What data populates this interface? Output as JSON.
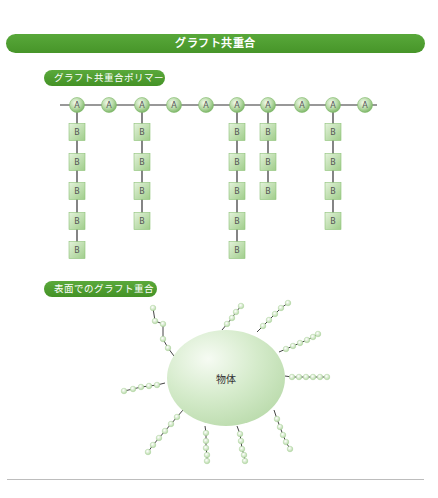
{
  "title": "グラフト共重合",
  "sections": {
    "polymer": {
      "label": "グラフト共重合ポリマー",
      "backbone": {
        "y": 105,
        "x_start": 60,
        "x_end": 377,
        "monomer_label": "A",
        "monomers_x": [
          77,
          109,
          142,
          174,
          206,
          237,
          268,
          302,
          333,
          365
        ]
      },
      "branch_label": "B",
      "branch_row_y": [
        132,
        162,
        191,
        221,
        250
      ],
      "branches": [
        {
          "monomer_index": 0,
          "count": 5
        },
        {
          "monomer_index": 2,
          "count": 4
        },
        {
          "monomer_index": 5,
          "count": 5
        },
        {
          "monomer_index": 6,
          "count": 3
        },
        {
          "monomer_index": 8,
          "count": 4
        }
      ]
    },
    "surface": {
      "label": "表面でのグラフト重合",
      "object_label": "物体",
      "object": {
        "cx": 226,
        "cy": 378,
        "rx": 59,
        "ry": 48
      },
      "chains": [
        [
          [
            174,
            356
          ],
          [
            168,
            348
          ],
          [
            163,
            339
          ],
          [
            163,
            324
          ],
          [
            155,
            321
          ],
          [
            153,
            308
          ]
        ],
        [
          [
            222,
            330
          ],
          [
            227,
            324
          ],
          [
            232,
            318
          ],
          [
            236,
            312
          ],
          [
            241,
            306
          ]
        ],
        [
          [
            257,
            332
          ],
          [
            263,
            326
          ],
          [
            269,
            320
          ],
          [
            275,
            314
          ],
          [
            281,
            308
          ],
          [
            288,
            303
          ]
        ],
        [
          [
            279,
            352
          ],
          [
            286,
            349
          ],
          [
            293,
            346
          ],
          [
            300,
            343
          ],
          [
            307,
            340
          ],
          [
            313,
            337
          ],
          [
            318,
            334
          ]
        ],
        [
          [
            285,
            376
          ],
          [
            292,
            377
          ],
          [
            299,
            377
          ],
          [
            306,
            377
          ],
          [
            313,
            377
          ],
          [
            320,
            377
          ],
          [
            327,
            377
          ]
        ],
        [
          [
            274,
            410
          ],
          [
            277,
            419
          ],
          [
            280,
            427
          ],
          [
            283,
            435
          ],
          [
            286,
            442
          ],
          [
            290,
            449
          ]
        ],
        [
          [
            237,
            426
          ],
          [
            240,
            434
          ],
          [
            241,
            441
          ],
          [
            242,
            449
          ],
          [
            244,
            455
          ],
          [
            245,
            461
          ]
        ],
        [
          [
            205,
            426
          ],
          [
            206,
            433
          ],
          [
            206,
            441
          ],
          [
            206,
            448
          ],
          [
            207,
            455
          ],
          [
            207,
            461
          ]
        ],
        [
          [
            183,
            410
          ],
          [
            177,
            417
          ],
          [
            171,
            424
          ],
          [
            165,
            431
          ],
          [
            159,
            438
          ],
          [
            153,
            445
          ],
          [
            148,
            452
          ]
        ],
        [
          [
            165,
            383
          ],
          [
            157,
            385
          ],
          [
            149,
            386
          ],
          [
            141,
            387
          ],
          [
            133,
            389
          ],
          [
            124,
            391
          ]
        ]
      ]
    }
  },
  "colors": {
    "header_green": "#4e9d2f",
    "bead_fill": "#b9dca8",
    "bead_stroke": "#7fb86a",
    "box_fill": "#bfe0ae",
    "line": "#333333",
    "object_fill": "#d8ecd0"
  }
}
